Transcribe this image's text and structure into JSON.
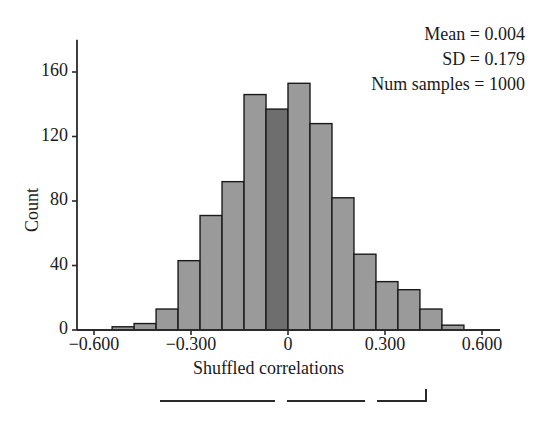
{
  "chart_data": {
    "type": "bar",
    "title": "",
    "xlabel": "Shuffled correlations",
    "ylabel": "Count",
    "xlim": [
      -0.54,
      0.58
    ],
    "ylim": [
      0,
      175
    ],
    "xticks": [
      -0.6,
      -0.3,
      0,
      0.3,
      0.6
    ],
    "xticklabels": [
      "−0.600",
      "−0.300",
      "0",
      "0.300",
      "0.600"
    ],
    "yticks": [
      0,
      40,
      80,
      120,
      160
    ],
    "yticklabels": [
      "0",
      "40",
      "80",
      "120",
      "160"
    ],
    "grid": false,
    "legend": "none",
    "bin_width": 0.068,
    "bin_centers": [
      -0.51,
      -0.442,
      -0.374,
      -0.306,
      -0.238,
      -0.17,
      -0.102,
      -0.034,
      0.034,
      0.102,
      0.17,
      0.238,
      0.306,
      0.374,
      0.442,
      0.51
    ],
    "categories": [
      "-0.510",
      "-0.442",
      "-0.374",
      "-0.306",
      "-0.238",
      "-0.170",
      "-0.102",
      "-0.034",
      "0.034",
      "0.102",
      "0.170",
      "0.238",
      "0.306",
      "0.374",
      "0.442",
      "0.510"
    ],
    "values": [
      2,
      4,
      13,
      43,
      71,
      92,
      146,
      137,
      153,
      128,
      82,
      47,
      30,
      25,
      13,
      3
    ],
    "highlight_index": 7,
    "bar_color": "#9a9a9a",
    "highlight_color": "#6e6e6e",
    "bar_edge_color": "#1a1a1a",
    "axis_color": "#2a2a2a"
  },
  "annotation": {
    "mean": "Mean = 0.004",
    "sd": "SD = 0.179",
    "num_samples": "Num samples = 1000"
  },
  "axes": {
    "ylabel": "Count",
    "xlabel": "Shuffled correlations"
  }
}
